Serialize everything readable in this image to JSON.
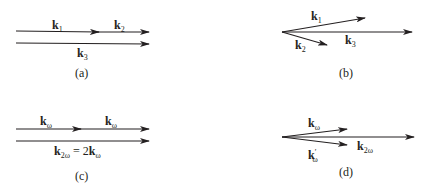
{
  "figure": {
    "panels": [
      {
        "id": "a",
        "caption": "(a)",
        "vectors": [
          {
            "name": "k",
            "sub": "1"
          },
          {
            "name": "k",
            "sub": "2"
          },
          {
            "name": "k",
            "sub": "3"
          }
        ],
        "description": "Collinear phase matching: k1 + k2 = k3"
      },
      {
        "id": "b",
        "caption": "(b)",
        "vectors": [
          {
            "name": "k",
            "sub": "1"
          },
          {
            "name": "k",
            "sub": "2"
          },
          {
            "name": "k",
            "sub": "3"
          }
        ],
        "description": "Non-collinear phase matching"
      },
      {
        "id": "c",
        "caption": "(c)",
        "vectors": [
          {
            "name": "k",
            "sub": "ω"
          },
          {
            "name": "k",
            "sub": "ω"
          }
        ],
        "equation": {
          "lhs_name": "k",
          "lhs_sub": "2ω",
          "rel": " = 2",
          "rhs_name": "k",
          "rhs_sub": "ω"
        },
        "description": "Collinear second-harmonic generation"
      },
      {
        "id": "d",
        "caption": "(d)",
        "vectors": [
          {
            "name": "k",
            "sub": "ω"
          },
          {
            "name": "k",
            "prime": "′",
            "sub": "ω"
          },
          {
            "name": "k",
            "sub": "2ω"
          }
        ],
        "description": "Non-collinear second-harmonic generation"
      }
    ],
    "colors": {
      "stroke": "#231f20",
      "background": "#ffffff"
    }
  }
}
